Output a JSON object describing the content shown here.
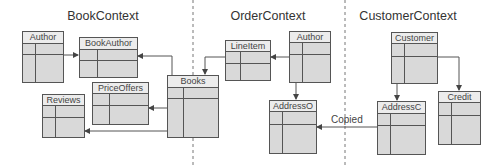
{
  "contexts": [
    {
      "title": "BookContext",
      "cx": 103
    },
    {
      "title": "OrderContext",
      "cx": 268
    },
    {
      "title": "CustomerContext",
      "cx": 408
    }
  ],
  "entities": {
    "author_book": {
      "name": "Author"
    },
    "book_author": {
      "name": "BookAuthor"
    },
    "price_offers": {
      "name": "PriceOffers"
    },
    "reviews": {
      "name": "Reviews"
    },
    "books": {
      "name": "Books"
    },
    "line_item": {
      "name": "LineItem"
    },
    "author_order": {
      "name": "Author"
    },
    "address_o": {
      "name": "AddressO"
    },
    "customer": {
      "name": "Customer"
    },
    "address_c": {
      "name": "AddressC"
    },
    "credit": {
      "name": "Credit"
    }
  },
  "annotations": {
    "copied": "Copied"
  },
  "colors": {
    "box_fill": "#d9d9d9",
    "header_fill": "#ececec",
    "line": "#555555",
    "dashed": "#777777"
  }
}
